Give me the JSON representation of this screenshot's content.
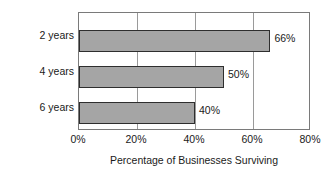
{
  "chart_data": {
    "type": "bar",
    "orientation": "horizontal",
    "title": "",
    "xlabel": "Percentage of Businesses Surviving",
    "ylabel": "Years since Being Started",
    "categories": [
      "2 years",
      "4 years",
      "6 years"
    ],
    "values": [
      66,
      50,
      40
    ],
    "data_labels": [
      "66%",
      "50%",
      "40%"
    ],
    "xlim": [
      0,
      80
    ],
    "xticks": [
      0,
      20,
      40,
      60,
      80
    ],
    "xtick_labels": [
      "0%",
      "20%",
      "40%",
      "60%",
      "80%"
    ],
    "grid": "vertical",
    "legend": "none",
    "bar_fill_color": "#a5a5a5",
    "bar_border_color": "#2e2e2e",
    "frame_color": "#7a7a7a",
    "gridline_color": "#9a9a9a",
    "text_color": "#1a1a1a"
  }
}
